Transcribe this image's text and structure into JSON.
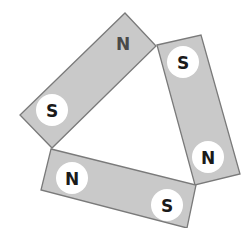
{
  "diagram": {
    "title": "",
    "colors": {
      "magnet_fill": "#c9c9c9",
      "magnet_border": "#7a7a7a",
      "pole_circle": "#ffffff",
      "label": "#1a1a1a"
    },
    "magnets": [
      {
        "name": "top-left magnet",
        "poles": [
          {
            "label": "N",
            "position": "upper-right end",
            "circled": false
          },
          {
            "label": "S",
            "position": "lower-left end",
            "circled": true
          }
        ]
      },
      {
        "name": "right magnet",
        "poles": [
          {
            "label": "S",
            "position": "top end",
            "circled": true
          },
          {
            "label": "N",
            "position": "bottom end",
            "circled": true
          }
        ]
      },
      {
        "name": "bottom magnet",
        "poles": [
          {
            "label": "N",
            "position": "left end",
            "circled": true
          },
          {
            "label": "S",
            "position": "right end",
            "circled": true
          }
        ]
      }
    ]
  }
}
